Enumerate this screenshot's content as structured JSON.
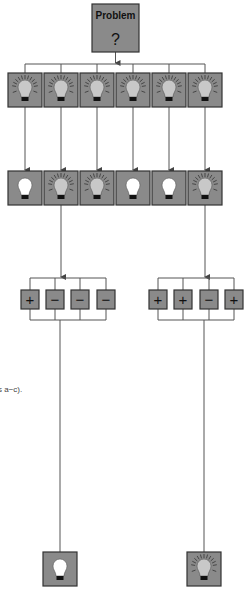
{
  "colors": {
    "box_fill": "#8a8a8a",
    "box_stroke": "#333333",
    "line": "#555555",
    "bulb_lit": "#c8c8c8",
    "bulb_unlit": "#ffffff"
  },
  "problem": {
    "title": "Problem",
    "symbol": "?"
  },
  "ideas": [
    {
      "state": "lit"
    },
    {
      "state": "lit"
    },
    {
      "state": "lit"
    },
    {
      "state": "lit"
    },
    {
      "state": "lit"
    },
    {
      "state": "lit"
    }
  ],
  "evaluated": [
    {
      "state": "unlit"
    },
    {
      "state": "lit"
    },
    {
      "state": "lit"
    },
    {
      "state": "unlit"
    },
    {
      "state": "unlit"
    },
    {
      "state": "lit"
    }
  ],
  "criteria_groups": [
    {
      "signs": [
        "+",
        "−",
        "−",
        "−"
      ],
      "result": "unlit"
    },
    {
      "signs": [
        "+",
        "+",
        "−",
        "+"
      ],
      "result": "lit"
    }
  ],
  "caption": "s a−c)."
}
